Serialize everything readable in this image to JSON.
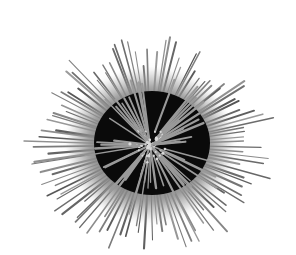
{
  "image": {
    "subject": "sea urchin",
    "background": "#ffffff",
    "width": 296,
    "height": 255
  },
  "urchin": {
    "center": [
      150,
      145
    ],
    "body_radius": [
      58,
      52
    ],
    "halo_radius": [
      85,
      78
    ],
    "spine_reach": [
      125,
      110
    ],
    "colors": {
      "body": "#0a0a0a",
      "halo": "#8a8a8a",
      "spine": "#7a7a7a",
      "spine_dark": "#555555",
      "inner_spine": "#9a9a9a",
      "tip": "#d8d8d8"
    },
    "outer_spine_count": 110,
    "inner_spine_count": 60
  }
}
